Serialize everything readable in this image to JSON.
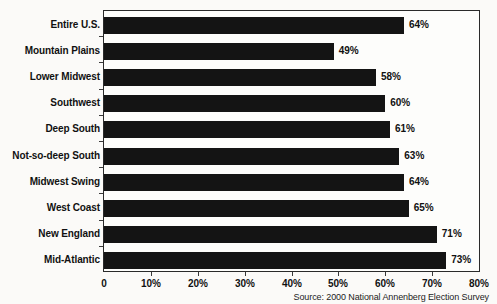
{
  "chart_data": {
    "type": "bar",
    "orientation": "horizontal",
    "title": "",
    "subtitle": "",
    "xlabel": "",
    "ylabel": "",
    "categories": [
      "Entire U.S.",
      "Mountain Plains",
      "Lower Midwest",
      "Southwest",
      "Deep South",
      "Not-so-deep South",
      "Midwest Swing",
      "West Coast",
      "New England",
      "Mid-Atlantic"
    ],
    "values": [
      64,
      49,
      58,
      60,
      61,
      63,
      64,
      65,
      71,
      73
    ],
    "value_labels": [
      "64%",
      "49%",
      "58%",
      "60%",
      "61%",
      "63%",
      "64%",
      "65%",
      "71%",
      "73%"
    ],
    "xlim": [
      0,
      80
    ],
    "xticks": [
      0,
      10,
      20,
      30,
      40,
      50,
      60,
      70,
      80
    ],
    "xtick_labels": [
      "0",
      "10%",
      "20%",
      "30%",
      "40%",
      "50%",
      "60%",
      "70%",
      "80%"
    ],
    "grid": false,
    "legend": null,
    "bar_color": "#141414",
    "frame_color": "#2a2a2a",
    "background_color": "#fbfaf8"
  },
  "source": {
    "text": "Source: 2000 National Annenberg Election Survey"
  }
}
